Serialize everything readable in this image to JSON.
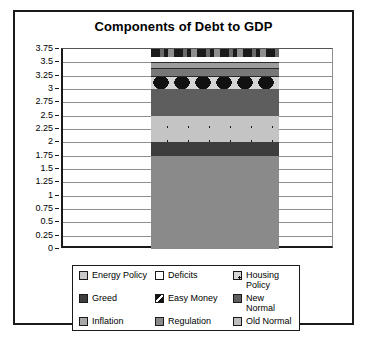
{
  "chart_data": {
    "type": "bar",
    "subtype": "stacked-column",
    "title": "Components of Debt to GDP",
    "xlabel": "",
    "ylabel": "",
    "ylim": [
      0,
      3.75
    ],
    "ytick_step": 0.25,
    "grid": true,
    "legend_position": "bottom",
    "categories": [
      ""
    ],
    "ytick_labels": [
      "3.75",
      "3.5",
      "3.25",
      "3",
      "2.75",
      "2.5",
      "2.25",
      "2",
      "1.75",
      "1.5",
      "1.25",
      "1",
      "0.75",
      "0.5",
      "0.25",
      "0"
    ],
    "series": [
      {
        "name": "Old Normal",
        "values": [
          1.75
        ],
        "start": 0.0,
        "end": 1.75,
        "fill": "#8a8a8a",
        "pattern": "solid"
      },
      {
        "name": "Greed",
        "values": [
          0.25
        ],
        "start": 1.75,
        "end": 2.0,
        "fill": "#3d3d3d",
        "pattern": "solid"
      },
      {
        "name": "Housing Policy",
        "values": [
          0.5
        ],
        "start": 2.0,
        "end": 2.5,
        "fill": "#c4c4c4",
        "pattern": "dots"
      },
      {
        "name": "New Normal",
        "values": [
          0.5
        ],
        "start": 2.5,
        "end": 3.0,
        "fill": "#5e5e5e",
        "pattern": "solid"
      },
      {
        "name": "Easy Money",
        "values": [
          0.25
        ],
        "start": 3.0,
        "end": 3.25,
        "fill": "#d5d5d5",
        "pattern": "circles"
      },
      {
        "name": "Regulation",
        "values": [
          0.15
        ],
        "start": 3.25,
        "end": 3.4,
        "fill": "#777777",
        "pattern": "solid"
      },
      {
        "name": "Inflation",
        "values": [
          0.1
        ],
        "start": 3.4,
        "end": 3.5,
        "fill": "#9c9c9c",
        "pattern": "solid"
      },
      {
        "name": "Deficits",
        "values": [
          0.1
        ],
        "start": 3.5,
        "end": 3.6,
        "fill": "#c9c9c9",
        "pattern": "solid"
      },
      {
        "name": "Energy Policy",
        "values": [
          0.15
        ],
        "start": 3.6,
        "end": 3.75,
        "fill": "#1a1a1a",
        "pattern": "dashes"
      }
    ]
  },
  "legend": {
    "entries": [
      {
        "label": "Energy Policy",
        "swatch": "light-gray"
      },
      {
        "label": "Deficits",
        "swatch": "white"
      },
      {
        "label": "Housing Policy",
        "swatch": "dotted"
      },
      {
        "label": "Greed",
        "swatch": "dark-gray"
      },
      {
        "label": "Easy Money",
        "swatch": "checkered"
      },
      {
        "label": "New Normal",
        "swatch": "dark-medium-gray"
      },
      {
        "label": "Inflation",
        "swatch": "medium-gray"
      },
      {
        "label": "Regulation",
        "swatch": "medium-dark-gray"
      },
      {
        "label": "Old Normal",
        "swatch": "gray"
      }
    ]
  }
}
